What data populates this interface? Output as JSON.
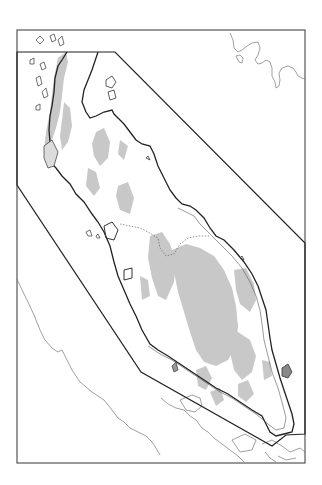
{
  "map": {
    "type": "outline map",
    "region": "peninsula with boundary polygon",
    "colors": {
      "background": "#ffffff",
      "frame": "#555555",
      "boundary": "#222222",
      "coastline": "#333333",
      "land_shading": "#c8c8c8",
      "foreign_coast": "#777777",
      "internal_border": "#666666"
    },
    "frame": {
      "x": 17,
      "y": 30,
      "width": 288,
      "height": 433
    },
    "boundary_polygon": [
      [
        17,
        52
      ],
      [
        115,
        52
      ],
      [
        305,
        243
      ],
      [
        305,
        434
      ],
      [
        286,
        435
      ],
      [
        272,
        446
      ],
      [
        141,
        372
      ],
      [
        17,
        185
      ]
    ],
    "labels": []
  }
}
